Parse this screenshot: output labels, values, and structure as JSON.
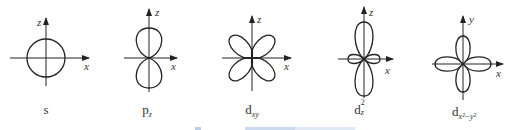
{
  "figure": {
    "panels": [
      {
        "id": "s",
        "label_main": "s",
        "label_sub": "",
        "label_sup": "",
        "vertical_axis": "z",
        "horizontal_axis": "x"
      },
      {
        "id": "pz",
        "label_main": "p",
        "label_sub": "z",
        "label_sup": "",
        "vertical_axis": "z",
        "horizontal_axis": "x"
      },
      {
        "id": "dxy",
        "label_main": "d",
        "label_sub": "xy",
        "label_sup": "",
        "vertical_axis": "z",
        "horizontal_axis": "x"
      },
      {
        "id": "dz2",
        "label_main": "d",
        "label_sub": "z",
        "label_sup": "2",
        "vertical_axis": "z",
        "horizontal_axis": "x"
      },
      {
        "id": "dx2y2",
        "label_main": "d",
        "label_sub": "x²−y²",
        "label_sup": "",
        "vertical_axis": "y",
        "horizontal_axis": "x"
      }
    ],
    "caption": "",
    "colors": {
      "line": "#222222",
      "text": "#333333",
      "caption": "#9fb8e0"
    }
  }
}
